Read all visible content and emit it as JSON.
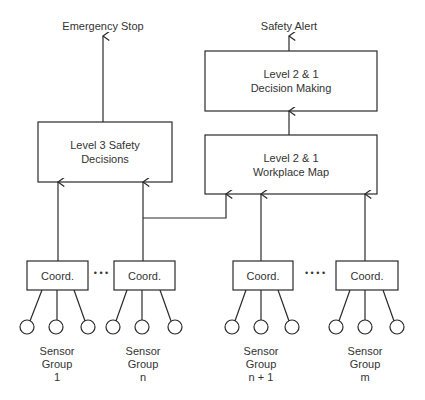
{
  "outputs": {
    "emergency_stop": "Emergency Stop",
    "safety_alert": "Safety Alert"
  },
  "boxes": {
    "level3": {
      "line1": "Level 3 Safety",
      "line2": "Decisions"
    },
    "decision_making": {
      "line1": "Level 2 & 1",
      "line2": "Decision Making"
    },
    "workplace_map": {
      "line1": "Level 2 & 1",
      "line2": "Workplace Map"
    }
  },
  "coordinators": [
    {
      "label": "Coord."
    },
    {
      "label": "Coord."
    },
    {
      "label": "Coord."
    },
    {
      "label": "Coord."
    }
  ],
  "ellipsis": [
    "• • •",
    "• • • •"
  ],
  "sensor_groups": [
    {
      "line1": "Sensor",
      "line2": "Group",
      "line3": "1"
    },
    {
      "line1": "Sensor",
      "line2": "Group",
      "line3": "n"
    },
    {
      "line1": "Sensor",
      "line2": "Group",
      "line3": "n + 1"
    },
    {
      "line1": "Sensor",
      "line2": "Group",
      "line3": "m"
    }
  ],
  "colors": {
    "stroke": "#2a2a2a",
    "background": "#ffffff"
  }
}
